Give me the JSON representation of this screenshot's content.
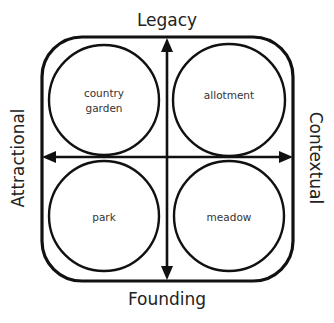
{
  "diagram": {
    "axes": {
      "top": "Legacy",
      "bottom": "Founding",
      "left": "Attractional",
      "right": "Contextual"
    },
    "quadrants": [
      {
        "position": "top-left",
        "lines": [
          "country",
          "garden"
        ]
      },
      {
        "position": "top-right",
        "lines": [
          "allotment"
        ]
      },
      {
        "position": "bottom-left",
        "lines": [
          "park"
        ]
      },
      {
        "position": "bottom-right",
        "lines": [
          "meadow"
        ]
      }
    ],
    "colors": {
      "stroke": "#111111",
      "text": "#222222",
      "background": "#ffffff"
    }
  }
}
